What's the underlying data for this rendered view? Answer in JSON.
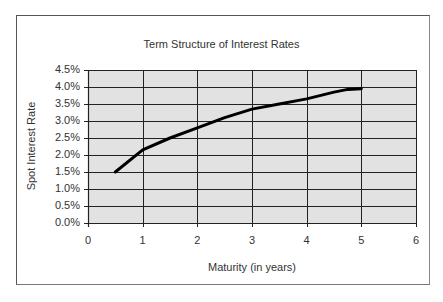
{
  "chart_data": {
    "type": "line",
    "title": "Term Structure of Interest Rates",
    "xlabel": "Maturity (in years)",
    "ylabel": "Spot Interest Rate",
    "xlim": [
      0,
      6
    ],
    "ylim": [
      0,
      4.5
    ],
    "x_ticks": [
      "0",
      "1",
      "2",
      "3",
      "4",
      "5",
      "6"
    ],
    "y_ticks": [
      "0.0%",
      "0.5%",
      "1.0%",
      "1.5%",
      "2.0%",
      "2.5%",
      "3.0%",
      "3.5%",
      "4.0%",
      "4.5%"
    ],
    "grid": true,
    "legend": null,
    "series": [
      {
        "name": "Spot Interest Rate",
        "x": [
          0.5,
          1,
          1.5,
          2,
          2.5,
          3,
          3.5,
          4,
          4.5,
          4.75,
          5
        ],
        "values": [
          1.5,
          2.15,
          2.5,
          2.8,
          3.1,
          3.35,
          3.5,
          3.65,
          3.85,
          3.93,
          3.95
        ]
      }
    ],
    "colors": {
      "plot_background": "#e2e2e2",
      "gridlines": "#222222",
      "line": "#000000"
    }
  }
}
